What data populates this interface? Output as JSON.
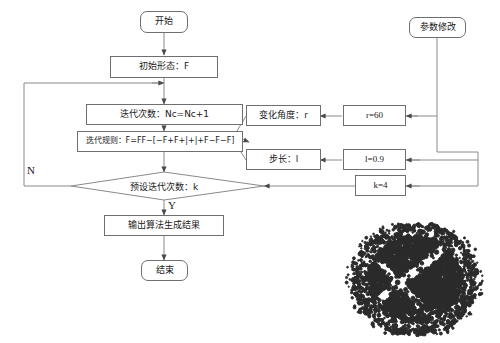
{
  "diagram": {
    "title_present": false,
    "line_color": "#6f6f6f",
    "text_color": "#1a1a1a",
    "fractal_color": "#2b2b2b",
    "background": "#ffffff"
  },
  "nodes": {
    "start": {
      "label": "开始",
      "shape": "rounded-rect"
    },
    "init_state": {
      "label": "初始形态：F",
      "shape": "rect"
    },
    "iter_count": {
      "label": "迭代次数：Nc=Nc+1",
      "shape": "rect"
    },
    "iter_rule": {
      "label": "迭代规则：F=FF−[−F+F+|+|+F−F−F]",
      "shape": "rect"
    },
    "decision": {
      "label": "预设迭代次数：k",
      "shape": "diamond"
    },
    "output": {
      "label": "输出算法生成结果",
      "shape": "rect"
    },
    "end": {
      "label": "结束",
      "shape": "rounded-rect"
    },
    "angle": {
      "label": "变化角度：r",
      "shape": "rect"
    },
    "step": {
      "label": "步长：l",
      "shape": "rect"
    },
    "angle_value": {
      "label": "r=60",
      "shape": "rect"
    },
    "step_value": {
      "label": "l=0.9",
      "shape": "rect"
    },
    "k_value": {
      "label": "k=4",
      "shape": "rect"
    },
    "param_edit": {
      "label": "参数修改",
      "shape": "rounded-rect"
    }
  },
  "edge_labels": {
    "no_branch": "N",
    "yes_branch": "Y"
  },
  "fractal": {
    "description": "L-system generated fractal pattern"
  }
}
